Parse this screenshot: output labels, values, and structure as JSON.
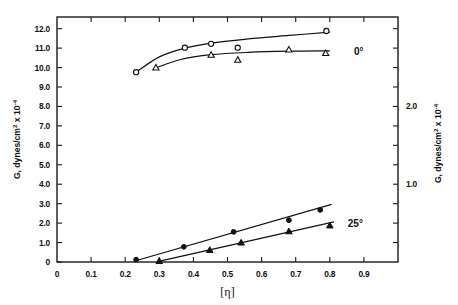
{
  "chart_data": {
    "type": "scatter",
    "title": "",
    "xlabel": "[η]",
    "ylabel": "G, dynes/cm² x 10⁻⁴",
    "ylabel_right": "G, dynes/cm² x 10⁻⁴",
    "xlim": [
      0,
      1.0
    ],
    "ylim": [
      0,
      12.6
    ],
    "ylim_right": [
      0,
      3.15
    ],
    "grid": false,
    "legend_position": "inline-right",
    "xticks": [
      0,
      0.1,
      0.2,
      0.3,
      0.4,
      0.5,
      0.6,
      0.7,
      0.8,
      0.9
    ],
    "xtick_labels": [
      "0",
      "0.1",
      "0.2",
      "0.3",
      "0.4",
      "0.5",
      "0.6",
      "0.7",
      "0.8",
      "0.9"
    ],
    "yticks": [
      0,
      1.0,
      2.0,
      3.0,
      4.0,
      5.0,
      6.0,
      7.0,
      8.0,
      9.0,
      10.0,
      11.0,
      12.0
    ],
    "ytick_labels": [
      "0",
      "1.0",
      "2.0",
      "3.0",
      "4.0",
      "5.0",
      "6.0",
      "7.0",
      "8.0",
      "9.0",
      "10.0",
      "11.0",
      "12.0"
    ],
    "yticks_right": [
      0.25,
      0.5,
      0.75,
      1.0,
      1.25,
      1.5,
      1.75,
      2.0,
      2.25,
      2.5,
      2.75,
      3.0
    ],
    "ytick_labels_right": {
      "2.0": "2.0",
      "1.0": "1.0"
    },
    "annotations": [
      {
        "text": "0°",
        "x": 0.885,
        "y": 10.8
      },
      {
        "text": "25°",
        "x": 0.875,
        "y": 1.95
      }
    ],
    "series": [
      {
        "name": "0° open-circle",
        "group": "0°",
        "marker": "open-circle",
        "axis": "left",
        "points": [
          {
            "x": 0.232,
            "y": 9.76
          },
          {
            "x": 0.375,
            "y": 11.02
          },
          {
            "x": 0.452,
            "y": 11.22
          },
          {
            "x": 0.53,
            "y": 11.02
          },
          {
            "x": 0.79,
            "y": 11.88
          }
        ],
        "fit_curve": [
          {
            "x": 0.232,
            "y": 9.76
          },
          {
            "x": 0.3,
            "y": 10.55
          },
          {
            "x": 0.375,
            "y": 11.0
          },
          {
            "x": 0.452,
            "y": 11.26
          },
          {
            "x": 0.56,
            "y": 11.47
          },
          {
            "x": 0.68,
            "y": 11.65
          },
          {
            "x": 0.8,
            "y": 11.82
          }
        ]
      },
      {
        "name": "0° open-triangle",
        "group": "0°",
        "marker": "open-triangle",
        "axis": "left",
        "points": [
          {
            "x": 0.29,
            "y": 10.0
          },
          {
            "x": 0.452,
            "y": 10.65
          },
          {
            "x": 0.53,
            "y": 10.4
          },
          {
            "x": 0.68,
            "y": 10.92
          },
          {
            "x": 0.788,
            "y": 10.74
          }
        ],
        "fit_curve": [
          {
            "x": 0.29,
            "y": 9.98
          },
          {
            "x": 0.36,
            "y": 10.4
          },
          {
            "x": 0.452,
            "y": 10.66
          },
          {
            "x": 0.56,
            "y": 10.78
          },
          {
            "x": 0.68,
            "y": 10.84
          },
          {
            "x": 0.8,
            "y": 10.86
          }
        ]
      },
      {
        "name": "25° filled-circle",
        "group": "25°",
        "marker": "filled-circle",
        "axis": "left",
        "points": [
          {
            "x": 0.232,
            "y": 0.12
          },
          {
            "x": 0.372,
            "y": 0.78
          },
          {
            "x": 0.518,
            "y": 1.55
          },
          {
            "x": 0.68,
            "y": 2.15
          },
          {
            "x": 0.772,
            "y": 2.68
          }
        ],
        "fit_line": [
          {
            "x": 0.228,
            "y": 0.05
          },
          {
            "x": 0.805,
            "y": 2.96
          }
        ]
      },
      {
        "name": "25° filled-triangle",
        "group": "25°",
        "marker": "filled-triangle",
        "axis": "left",
        "points": [
          {
            "x": 0.3,
            "y": 0.05
          },
          {
            "x": 0.448,
            "y": 0.62
          },
          {
            "x": 0.54,
            "y": 1.0
          },
          {
            "x": 0.68,
            "y": 1.58
          },
          {
            "x": 0.8,
            "y": 1.88
          }
        ],
        "fit_line": [
          {
            "x": 0.295,
            "y": 0.02
          },
          {
            "x": 0.812,
            "y": 2.06
          }
        ]
      }
    ]
  }
}
